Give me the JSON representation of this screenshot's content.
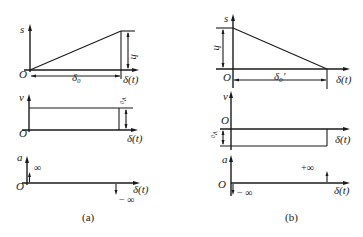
{
  "figure": {
    "panel_a": {
      "caption": "(a)",
      "displacement": {
        "y_label": "s",
        "origin": "O",
        "x_label": "δ(t)",
        "span_label": "δ₀",
        "height_label": "h",
        "shape": "linear rise from 0 to h over δ₀"
      },
      "velocity": {
        "y_label": "v",
        "origin": "O",
        "x_label": "δ(t)",
        "value_label": "v₀",
        "shape": "constant positive v₀"
      },
      "acceleration": {
        "y_label": "a",
        "origin": "O",
        "x_label": "δ(t)",
        "start_label": "∞",
        "end_label": "− ∞",
        "shape": "impulse +∞ at start, −∞ at end"
      }
    },
    "panel_b": {
      "caption": "(b)",
      "displacement": {
        "y_label": "s",
        "origin": "O",
        "x_label": "δ(t)",
        "span_label": "δ₀′",
        "height_label": "h",
        "shape": "linear fall from h to 0 over δ₀′"
      },
      "velocity": {
        "y_label": "v",
        "origin": "O",
        "x_label": "δ(t)",
        "value_label": "v₀",
        "shape": "constant negative v₀"
      },
      "acceleration": {
        "y_label": "a",
        "origin": "O",
        "x_label": "δ(t)",
        "start_label": "− ∞",
        "end_label": "+∞",
        "shape": "impulse −∞ at start, +∞ at end"
      }
    }
  },
  "colors": {
    "ink": "#1a1a1a",
    "background": "#ffffff"
  }
}
